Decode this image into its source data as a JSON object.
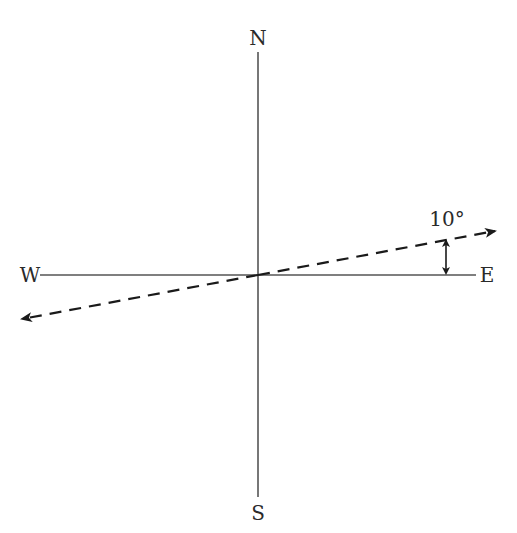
{
  "diagram": {
    "type": "compass-bearing",
    "directions": {
      "north": "N",
      "south": "S",
      "west": "W",
      "east": "E"
    },
    "angle_label": "10°",
    "angle_degrees": 10,
    "vector": {
      "style": "dashed",
      "direction": "10° north of east, bidirectional",
      "arrowheads": [
        "east-northeast",
        "west-southwest"
      ]
    },
    "colors": {
      "axis": "#555555",
      "vector": "#1a1a1a",
      "text": "#2a2a2a"
    }
  }
}
